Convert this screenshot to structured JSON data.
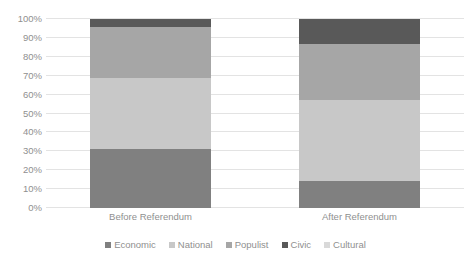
{
  "chart_data": {
    "type": "bar",
    "stacked": true,
    "stack_mode": "percent",
    "title": "",
    "xlabel": "",
    "ylabel": "",
    "ylim": [
      0,
      100
    ],
    "grid": true,
    "legend_position": "bottom",
    "categories": [
      "Before Referendum",
      "After Referendum"
    ],
    "ytick_labels": [
      "0%",
      "10%",
      "20%",
      "30%",
      "40%",
      "50%",
      "60%",
      "70%",
      "80%",
      "90%",
      "100%"
    ],
    "ytick_values": [
      0,
      10,
      20,
      30,
      40,
      50,
      60,
      70,
      80,
      90,
      100
    ],
    "series": [
      {
        "name": "Economic",
        "color": "#808080",
        "values": [
          31,
          14.5
        ]
      },
      {
        "name": "National",
        "color": "#c8c8c8",
        "values": [
          38,
          42.5
        ]
      },
      {
        "name": "Populist",
        "color": "#a6a6a6",
        "values": [
          27,
          30
        ]
      },
      {
        "name": "Civic",
        "color": "#595959",
        "values": [
          4,
          13
        ]
      },
      {
        "name": "Cultural",
        "color": "#d9d9d9",
        "values": [
          0,
          0
        ]
      }
    ]
  },
  "colors": {
    "economic": "#808080",
    "national": "#c8c8c8",
    "populist": "#a6a6a6",
    "civic": "#595959",
    "cultural": "#d9d9d9",
    "gridline": "#e3e3e3",
    "text": "#8f8f8f",
    "background": "#ffffff"
  }
}
